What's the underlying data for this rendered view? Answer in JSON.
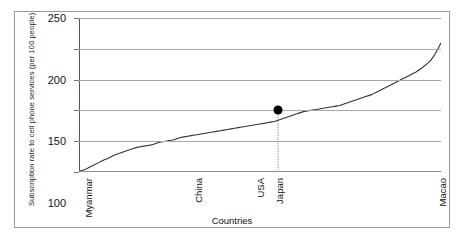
{
  "chart_data": {
    "type": "line",
    "title": "",
    "xlabel": "Countries",
    "ylabel": "Subscription rate to cell phone services (per 100 people)",
    "ylim": [
      0,
      250
    ],
    "yticks": [
      0,
      50,
      100,
      150,
      200,
      250
    ],
    "grid": true,
    "legend": null,
    "x_category_labels": [
      {
        "label": "Myanmar",
        "position_pct": 1.0
      },
      {
        "label": "China",
        "position_pct": 31.5
      },
      {
        "label": "USA",
        "position_pct": 48.5
      },
      {
        "label": "Japan",
        "position_pct": 54.0
      },
      {
        "label": "Macao",
        "position_pct": 99.0
      }
    ],
    "annotation": {
      "country": "Japan",
      "value": 100,
      "marker": "filled-circle",
      "dropline": "dotted"
    },
    "series": [
      {
        "name": "Subscription rate",
        "x": [
          0,
          1,
          2,
          3,
          4,
          5,
          6,
          7,
          8,
          9,
          10,
          11,
          12,
          13,
          14,
          15,
          16,
          17,
          18,
          19,
          20,
          21,
          22,
          23,
          24,
          25,
          26,
          27,
          28,
          29,
          30,
          31,
          32,
          33,
          34,
          35,
          36,
          37,
          38,
          39,
          40,
          41,
          42,
          43,
          44,
          45,
          46,
          47,
          48,
          49,
          50,
          51,
          52,
          53,
          54,
          55,
          56,
          57,
          58,
          59,
          60,
          61,
          62,
          63,
          64,
          65,
          66,
          67,
          68,
          69,
          70,
          71,
          72,
          73,
          74,
          75,
          76,
          77,
          78,
          79,
          80,
          81,
          82,
          83,
          84,
          85,
          86,
          87,
          88,
          89,
          90,
          91,
          92,
          93,
          94,
          95,
          96,
          97,
          98,
          99,
          100
        ],
        "values": [
          1,
          3,
          5,
          8,
          11,
          14,
          17,
          20,
          22,
          25,
          28,
          30,
          32,
          34,
          36,
          38,
          40,
          41,
          42,
          43,
          44,
          46,
          48,
          49,
          50,
          51,
          52,
          54,
          56,
          57,
          58,
          59,
          60,
          61,
          62,
          63,
          64,
          65,
          66,
          67,
          68,
          69,
          70,
          71,
          72,
          73,
          74,
          75,
          76,
          77,
          78,
          79,
          80,
          81,
          82,
          84,
          86,
          88,
          90,
          92,
          94,
          96,
          98,
          99,
          100,
          101,
          102,
          103,
          104,
          105,
          106,
          107,
          108,
          110,
          112,
          114,
          116,
          118,
          120,
          122,
          124,
          126,
          129,
          132,
          135,
          138,
          141,
          144,
          147,
          150,
          153,
          156,
          159,
          162,
          166,
          170,
          175,
          180,
          188,
          198,
          210
        ]
      }
    ]
  }
}
